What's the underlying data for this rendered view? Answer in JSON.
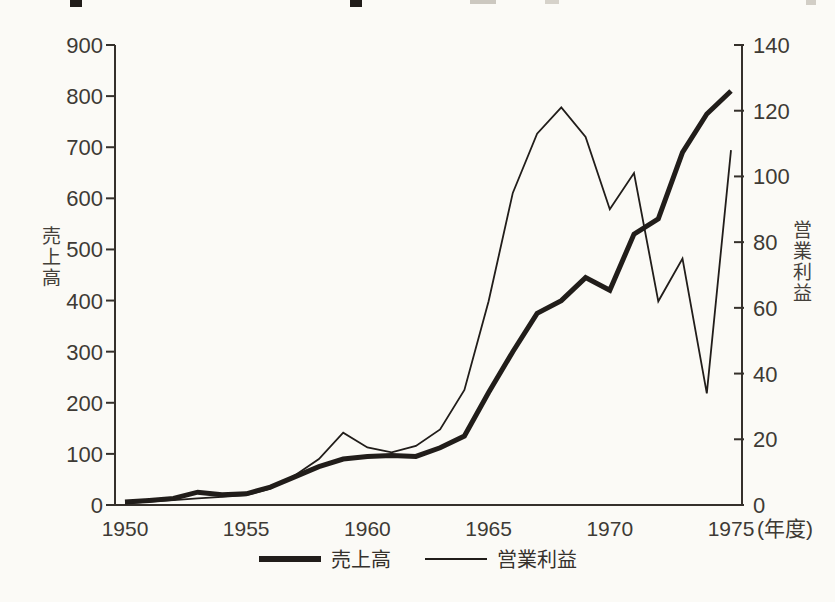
{
  "colors": {
    "ink": "#211d1a",
    "axis": "#35302b",
    "label": "#3e3a35",
    "background": "#fbfaf6"
  },
  "chart_data": {
    "type": "line",
    "title": "",
    "x": [
      1950,
      1951,
      1952,
      1953,
      1954,
      1955,
      1956,
      1957,
      1958,
      1959,
      1960,
      1961,
      1962,
      1963,
      1964,
      1965,
      1966,
      1967,
      1968,
      1969,
      1970,
      1971,
      1972,
      1973,
      1974,
      1975
    ],
    "x_tick_labels": [
      "1950",
      "1955",
      "1960",
      "1965",
      "1970",
      "1975"
    ],
    "x_axis_suffix": "(年度)",
    "left_axis": {
      "label": "売上高",
      "range": [
        0,
        900
      ],
      "ticks": [
        0,
        100,
        200,
        300,
        400,
        500,
        600,
        700,
        800,
        900
      ]
    },
    "right_axis": {
      "label": "営業利益",
      "range": [
        0,
        140
      ],
      "ticks": [
        0,
        20,
        40,
        60,
        80,
        100,
        120,
        140
      ]
    },
    "grid": false,
    "legend_position": "bottom",
    "series": [
      {
        "name": "売上高",
        "axis": "left",
        "style": "thick",
        "stroke_width": 5,
        "values": [
          6,
          9,
          13,
          25,
          20,
          22,
          35,
          55,
          75,
          90,
          95,
          97,
          95,
          112,
          135,
          220,
          300,
          375,
          400,
          445,
          420,
          530,
          560,
          690,
          765,
          810
        ]
      },
      {
        "name": "営業利益",
        "axis": "right",
        "style": "thin",
        "stroke_width": 1.8,
        "values": [
          0.5,
          1,
          1.5,
          2,
          2.5,
          3,
          5,
          9,
          14,
          22,
          17.5,
          16,
          18,
          23,
          35,
          62,
          95,
          113,
          121,
          112,
          90,
          101,
          62,
          75,
          34,
          108
        ]
      }
    ],
    "legend": [
      "売上高",
      "営業利益"
    ]
  }
}
